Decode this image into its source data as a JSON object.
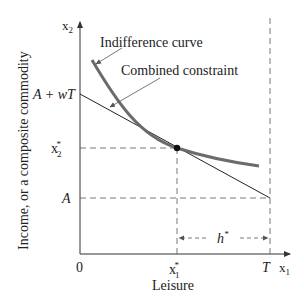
{
  "diagram": {
    "y_axis_label": "Income, or a composite commodity",
    "x_axis_label": "Leisure",
    "y_axis_var": "x",
    "y_axis_var_sub": "2",
    "x_axis_var": "x",
    "x_axis_var_sub": "1",
    "origin": "0",
    "ticks_y": {
      "a_plus_wt": "A + wT",
      "x2_star_base": "x",
      "x2_star_sub": "2",
      "x2_star_sup": "*",
      "a": "A"
    },
    "ticks_x": {
      "x1_star_base": "x",
      "x1_star_sub": "1",
      "x1_star_sup": "*",
      "t": "T"
    },
    "annotations": {
      "indifference_curve": "Indifference curve",
      "combined_constraint": "Combined constraint",
      "h_star_base": "h",
      "h_star_sup": "*"
    },
    "colors": {
      "curve": "#6b6b6b",
      "line": "#222222",
      "dashed": "#555555"
    }
  }
}
